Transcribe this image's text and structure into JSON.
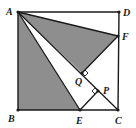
{
  "diagram": {
    "type": "geometry",
    "colors": {
      "line": "#1a1a1a",
      "shade": "#8e8e8e",
      "background": "#ffffff"
    },
    "points": {
      "A": {
        "label": "A",
        "x": 18,
        "y": 12
      },
      "B": {
        "label": "B",
        "x": 18,
        "y": 110
      },
      "C": {
        "label": "C",
        "x": 118,
        "y": 110
      },
      "D": {
        "label": "D",
        "x": 119,
        "y": 12
      },
      "E": {
        "label": "E",
        "x": 80,
        "y": 110
      },
      "F": {
        "label": "F",
        "x": 118,
        "y": 36
      },
      "Q": {
        "label": "Q",
        "x": 82,
        "y": 73
      },
      "P": {
        "label": "P",
        "x": 98,
        "y": 91
      }
    },
    "shaded_regions": [
      "ABE",
      "AQF"
    ],
    "segments": [
      "AB",
      "BC",
      "CD",
      "DA",
      "AC",
      "AE",
      "AF",
      "QF",
      "EP"
    ],
    "right_angle_marks": [
      "Q",
      "P"
    ]
  }
}
